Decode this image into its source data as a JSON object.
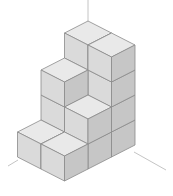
{
  "figure": {
    "grid": {
      "depth": 3,
      "width": 2
    },
    "heights": [
      [
        4,
        4
      ],
      [
        3,
        2
      ],
      [
        1,
        1
      ]
    ],
    "cube_count": 15,
    "colors": {
      "top": "#e9e9e9",
      "left": "#dadada",
      "right": "#c6c6c6",
      "edge": "#8a8a8a",
      "axis": "#b5b5b5"
    }
  }
}
